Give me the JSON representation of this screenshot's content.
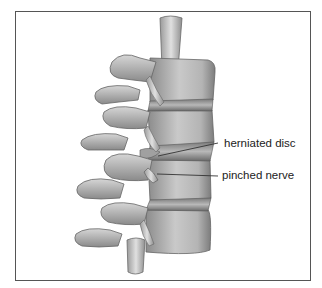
{
  "figure": {
    "labels": [
      {
        "text": "herniated disc"
      },
      {
        "text": "pinched nerve"
      }
    ],
    "colors": {
      "frame_border": "#555555",
      "background": "#ffffff",
      "bone_light": "#dcdcdc",
      "bone_mid": "#a9a9a9",
      "bone_dark": "#6e6e6e",
      "label_text": "#222222",
      "leader_line": "#333333"
    }
  }
}
